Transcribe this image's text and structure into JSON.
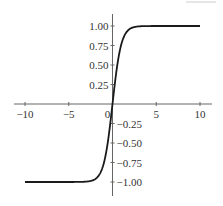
{
  "chart_data": {
    "type": "line",
    "title": "",
    "xlabel": "",
    "ylabel": "",
    "function": "tanh(x)",
    "xlim": [
      -10,
      10
    ],
    "ylim": [
      -1.0,
      1.0
    ],
    "grid": false,
    "legend": null,
    "x_ticks": [
      -10,
      -5,
      0,
      5,
      10
    ],
    "x_tick_labels": [
      "−10",
      "−5",
      "0",
      "5",
      "10"
    ],
    "y_ticks": [
      1.0,
      0.75,
      0.5,
      0.25,
      -0.25,
      -0.5,
      -0.75,
      -1.0
    ],
    "y_tick_labels": [
      "1.00",
      "0.75",
      "0.50",
      "0.25",
      "−0.25",
      "−0.50",
      "−0.75",
      "−1.00"
    ],
    "series": [
      {
        "name": "tanh(x)",
        "color": "#1a1a1a",
        "x": [
          -10,
          -5,
          -3,
          -2.5,
          -2,
          -1.5,
          -1,
          -0.5,
          0,
          0.5,
          1,
          1.5,
          2,
          2.5,
          3,
          5,
          10
        ],
        "y": [
          -1.0,
          -0.9999,
          -0.995,
          -0.987,
          -0.964,
          -0.905,
          -0.762,
          -0.462,
          0.0,
          0.462,
          0.762,
          0.905,
          0.964,
          0.987,
          0.995,
          0.9999,
          1.0
        ]
      }
    ]
  },
  "colors": {
    "axis": "#666666",
    "curve": "#1a1a1a",
    "text": "#333333"
  }
}
